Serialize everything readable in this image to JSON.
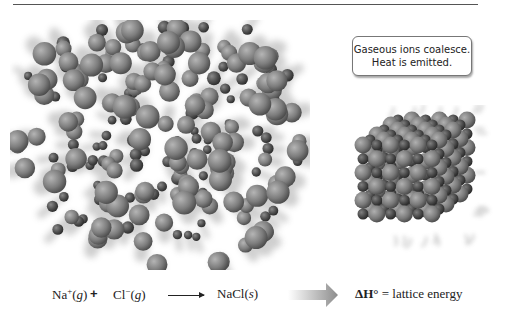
{
  "figure": {
    "callout": {
      "line1": "Gaseous ions coalesce.",
      "line2": "Heat is emitted."
    },
    "colors": {
      "ion_large": "#8a8a8a",
      "ion_small": "#5a5a5a",
      "rule": "#555555",
      "text": "#222222"
    }
  },
  "equation": {
    "reactant1": {
      "symbol": "Na",
      "charge": "+",
      "state": "g"
    },
    "plus": "+",
    "reactant2": {
      "symbol": "Cl",
      "charge": "−",
      "state": "g"
    },
    "product": {
      "symbol": "NaCl",
      "state": "s"
    },
    "result_lhs": "ΔH°",
    "equals": "=",
    "result_rhs": "lattice energy"
  }
}
